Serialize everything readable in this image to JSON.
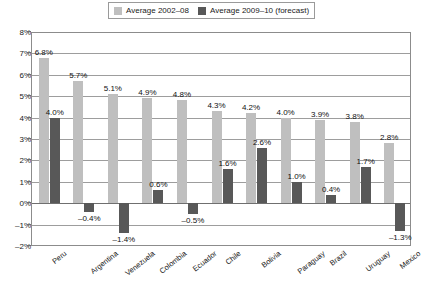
{
  "legend": {
    "entries": [
      {
        "label": "Average 2002–08",
        "color": "#bfbfbf",
        "swatch_name": "legend-swatch-average-2002-08"
      },
      {
        "label": "Average 2009–10 (forecast)",
        "color": "#585858",
        "swatch_name": "legend-swatch-average-2009-10"
      }
    ]
  },
  "axes": {
    "y_ticks": [
      "8%",
      "7%",
      "6%",
      "5%",
      "4%",
      "3%",
      "2%",
      "1%",
      "0%",
      "–1%",
      "–2%"
    ],
    "y_min": -2,
    "y_max": 8,
    "y_step": 1
  },
  "chart_data": {
    "type": "bar",
    "title": "",
    "xlabel": "",
    "ylabel": "",
    "ylim": [
      -2,
      8
    ],
    "grid": true,
    "legend_position": "top",
    "categories": [
      "Peru",
      "Argentina",
      "Venezuela",
      "Colombia",
      "Ecuador",
      "Chile",
      "Bolivia",
      "Paraguay",
      "Brazil",
      "Uruguay",
      "Mexico"
    ],
    "series": [
      {
        "name": "Average 2002–08",
        "color": "#bfbfbf",
        "values": [
          6.8,
          5.7,
          5.1,
          4.9,
          4.8,
          4.3,
          4.2,
          4.0,
          3.9,
          3.8,
          2.8
        ],
        "labels": [
          "6.8%",
          "5.7%",
          "5.1%",
          "4.9%",
          "4.8%",
          "4.3%",
          "4.2%",
          "4.0%",
          "3.9%",
          "3.8%",
          "2.8%"
        ]
      },
      {
        "name": "Average 2009–10 (forecast)",
        "color": "#585858",
        "values": [
          4.0,
          -0.4,
          -1.4,
          0.6,
          -0.5,
          1.6,
          2.6,
          1.0,
          0.4,
          1.7,
          -1.3
        ],
        "labels": [
          "4.0%",
          "–0.4%",
          "–1.4%",
          "0.6%",
          "–0.5%",
          "1.6%",
          "2.6%",
          "1.0%",
          "0.4%",
          "1.7%",
          "–1.3%"
        ]
      }
    ]
  }
}
